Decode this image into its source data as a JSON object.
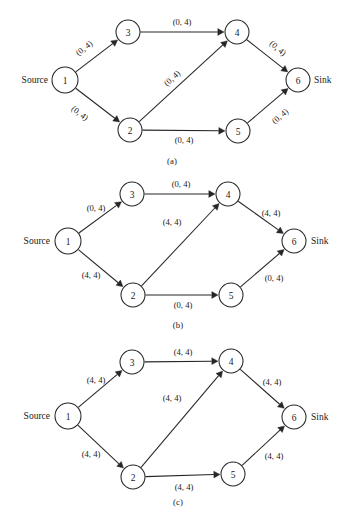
{
  "figure": {
    "panels": [
      {
        "id": "a",
        "caption": "(a)",
        "caption_pos": {
          "x": 172,
          "y": 161
        },
        "source_label": "Source",
        "sink_label": "Sink",
        "label_style": "rotated",
        "nodes": [
          {
            "id": "1",
            "label": "1",
            "x": 65,
            "y": 80,
            "r": 13
          },
          {
            "id": "2",
            "label": "2",
            "x": 130,
            "y": 130,
            "r": 12
          },
          {
            "id": "3",
            "label": "3",
            "x": 128,
            "y": 32,
            "r": 12
          },
          {
            "id": "4",
            "label": "4",
            "x": 237,
            "y": 32,
            "r": 12
          },
          {
            "id": "5",
            "label": "5",
            "x": 238,
            "y": 131,
            "r": 12
          },
          {
            "id": "6",
            "label": "6",
            "x": 298,
            "y": 80,
            "r": 12
          }
        ],
        "source_pos": {
          "x": 48,
          "y": 80
        },
        "sink_pos": {
          "x": 314,
          "y": 80
        },
        "edges": [
          {
            "from": "1",
            "to": "3",
            "label": "(0, 4)",
            "lx": 84,
            "ly": 48,
            "rot": -38
          },
          {
            "from": "1",
            "to": "2",
            "label": "(0, 4)",
            "lx": 80,
            "ly": 113,
            "rot": 38
          },
          {
            "from": "3",
            "to": "4",
            "label": "(0, 4)",
            "lx": 182,
            "ly": 22,
            "rot": 0
          },
          {
            "from": "2",
            "to": "4",
            "label": "(0, 4)",
            "lx": 172,
            "ly": 78,
            "rot": -42
          },
          {
            "from": "2",
            "to": "5",
            "label": "(0, 4)",
            "lx": 184,
            "ly": 140,
            "rot": 0
          },
          {
            "from": "4",
            "to": "6",
            "label": "(0, 4)",
            "lx": 278,
            "ly": 48,
            "rot": 40
          },
          {
            "from": "5",
            "to": "6",
            "label": "(0, 4)",
            "lx": 280,
            "ly": 116,
            "rot": -40
          }
        ]
      },
      {
        "id": "b",
        "caption": "(b)",
        "caption_pos": {
          "x": 178,
          "y": 155
        },
        "source_label": "Source",
        "sink_label": "Sink",
        "label_style": "horizontal",
        "nodes": [
          {
            "id": "1",
            "label": "1",
            "x": 68,
            "y": 71,
            "r": 13
          },
          {
            "id": "2",
            "label": "2",
            "x": 133,
            "y": 125,
            "r": 12
          },
          {
            "id": "3",
            "label": "3",
            "x": 132,
            "y": 24,
            "r": 12
          },
          {
            "id": "4",
            "label": "4",
            "x": 228,
            "y": 24,
            "r": 12
          },
          {
            "id": "5",
            "label": "5",
            "x": 231,
            "y": 125,
            "r": 12
          },
          {
            "id": "6",
            "label": "6",
            "x": 294,
            "y": 71,
            "r": 12
          }
        ],
        "source_pos": {
          "x": 50,
          "y": 71
        },
        "sink_pos": {
          "x": 311,
          "y": 71
        },
        "edges": [
          {
            "from": "1",
            "to": "3",
            "label": "(0, 4)",
            "lx": 96,
            "ly": 38,
            "rot": 0
          },
          {
            "from": "1",
            "to": "2",
            "label": "(4, 4)",
            "lx": 91,
            "ly": 105,
            "rot": 0
          },
          {
            "from": "3",
            "to": "4",
            "label": "(0, 4)",
            "lx": 181,
            "ly": 14,
            "rot": 0
          },
          {
            "from": "2",
            "to": "4",
            "label": "(4, 4)",
            "lx": 172,
            "ly": 52,
            "rot": 0
          },
          {
            "from": "2",
            "to": "5",
            "label": "(0, 4)",
            "lx": 183,
            "ly": 135,
            "rot": 0
          },
          {
            "from": "4",
            "to": "6",
            "label": "(4, 4)",
            "lx": 271,
            "ly": 43,
            "rot": 0
          },
          {
            "from": "5",
            "to": "6",
            "label": "(0, 4)",
            "lx": 274,
            "ly": 108,
            "rot": 0
          }
        ]
      },
      {
        "id": "c",
        "caption": "(c)",
        "caption_pos": {
          "x": 178,
          "y": 160
        },
        "source_label": "Source",
        "sink_label": "Sink",
        "label_style": "horizontal",
        "nodes": [
          {
            "id": "1",
            "label": "1",
            "x": 68,
            "y": 74,
            "r": 13
          },
          {
            "id": "2",
            "label": "2",
            "x": 133,
            "y": 135,
            "r": 12
          },
          {
            "id": "3",
            "label": "3",
            "x": 132,
            "y": 20,
            "r": 12
          },
          {
            "id": "4",
            "label": "4",
            "x": 231,
            "y": 19,
            "r": 12
          },
          {
            "id": "5",
            "label": "5",
            "x": 233,
            "y": 132,
            "r": 12
          },
          {
            "id": "6",
            "label": "6",
            "x": 294,
            "y": 75,
            "r": 12
          }
        ],
        "source_pos": {
          "x": 50,
          "y": 74
        },
        "sink_pos": {
          "x": 311,
          "y": 75
        },
        "edges": [
          {
            "from": "1",
            "to": "3",
            "label": "(4, 4)",
            "lx": 96,
            "ly": 38,
            "rot": 0
          },
          {
            "from": "1",
            "to": "2",
            "label": "(4, 4)",
            "lx": 91,
            "ly": 112,
            "rot": 0
          },
          {
            "from": "3",
            "to": "4",
            "label": "(4, 4)",
            "lx": 183,
            "ly": 10,
            "rot": 0
          },
          {
            "from": "2",
            "to": "4",
            "label": "(4, 4)",
            "lx": 172,
            "ly": 56,
            "rot": 0
          },
          {
            "from": "2",
            "to": "5",
            "label": "(4, 4)",
            "lx": 184,
            "ly": 145,
            "rot": 0
          },
          {
            "from": "4",
            "to": "6",
            "label": "(4, 4)",
            "lx": 272,
            "ly": 40,
            "rot": 0
          },
          {
            "from": "5",
            "to": "6",
            "label": "(4, 4)",
            "lx": 274,
            "ly": 114,
            "rot": 0
          }
        ]
      }
    ]
  },
  "chart_data": {
    "type": "diagram",
    "title": "",
    "node_ids": [
      "1",
      "2",
      "3",
      "4",
      "5",
      "6"
    ],
    "source_node": "1",
    "sink_node": "6",
    "arcs": [
      "1->3",
      "1->2",
      "3->4",
      "2->4",
      "2->5",
      "4->6",
      "5->6"
    ],
    "panels": [
      {
        "label": "(a)",
        "arc_values": {
          "1->3": [
            0,
            4
          ],
          "1->2": [
            0,
            4
          ],
          "3->4": [
            0,
            4
          ],
          "2->4": [
            0,
            4
          ],
          "2->5": [
            0,
            4
          ],
          "4->6": [
            0,
            4
          ],
          "5->6": [
            0,
            4
          ]
        }
      },
      {
        "label": "(b)",
        "arc_values": {
          "1->3": [
            0,
            4
          ],
          "1->2": [
            4,
            4
          ],
          "3->4": [
            0,
            4
          ],
          "2->4": [
            4,
            4
          ],
          "2->5": [
            0,
            4
          ],
          "4->6": [
            4,
            4
          ],
          "5->6": [
            0,
            4
          ]
        }
      },
      {
        "label": "(c)",
        "arc_values": {
          "1->3": [
            4,
            4
          ],
          "1->2": [
            4,
            4
          ],
          "3->4": [
            4,
            4
          ],
          "2->4": [
            4,
            4
          ],
          "2->5": [
            4,
            4
          ],
          "4->6": [
            4,
            4
          ],
          "5->6": [
            4,
            4
          ]
        }
      }
    ]
  }
}
